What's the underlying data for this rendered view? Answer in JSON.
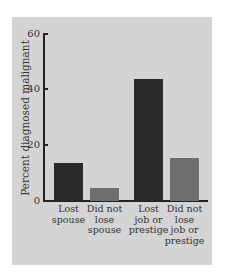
{
  "chart_data": {
    "type": "bar",
    "title": "",
    "xlabel": "",
    "ylabel": "Percent diagnosed malignant",
    "ylim": [
      0,
      60
    ],
    "yticks": [
      0,
      20,
      40,
      60
    ],
    "grid": false,
    "categories": [
      "Lost spouse",
      "Did not lose spouse",
      "Lost job or prestige",
      "Did not lose job or prestige"
    ],
    "category_labels": [
      "Lost\nspouse",
      "Did not\nlose\nspouse",
      "Lost\njob or\nprestige",
      "Did not\nlose\njob or\nprestige"
    ],
    "values": [
      13.5,
      4.5,
      43.5,
      15.5
    ],
    "bar_colors": [
      "#2a2a2a",
      "#6e6e6e",
      "#2a2a2a",
      "#6e6e6e"
    ]
  },
  "axis": {
    "ytick_labels": [
      "0",
      "20",
      "40",
      "60"
    ]
  }
}
